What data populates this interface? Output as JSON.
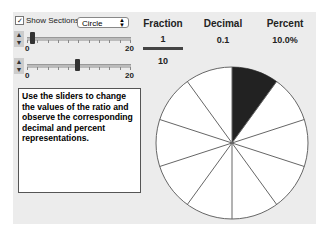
{
  "controls": {
    "show_sections_label": "Show Sections",
    "show_sections_checked": true,
    "shape_select": "Circle",
    "numerator_slider": {
      "min_label": "0",
      "max_label": "20",
      "value": 1,
      "min": 0,
      "max": 20
    },
    "denominator_slider": {
      "min_label": "0",
      "max_label": "20",
      "value": 10,
      "min": 0,
      "max": 20
    }
  },
  "instructions": "Use the sliders to change the values of the ratio and observe the corresponding decimal and percent representations.",
  "headers": {
    "fraction": "Fraction",
    "decimal": "Decimal",
    "percent": "Percent"
  },
  "values": {
    "numerator": "1",
    "denominator": "10",
    "decimal": "0.1",
    "percent": "10.0%"
  },
  "circle": {
    "sections": 10,
    "shaded": 1,
    "shade_color": "#222222"
  }
}
